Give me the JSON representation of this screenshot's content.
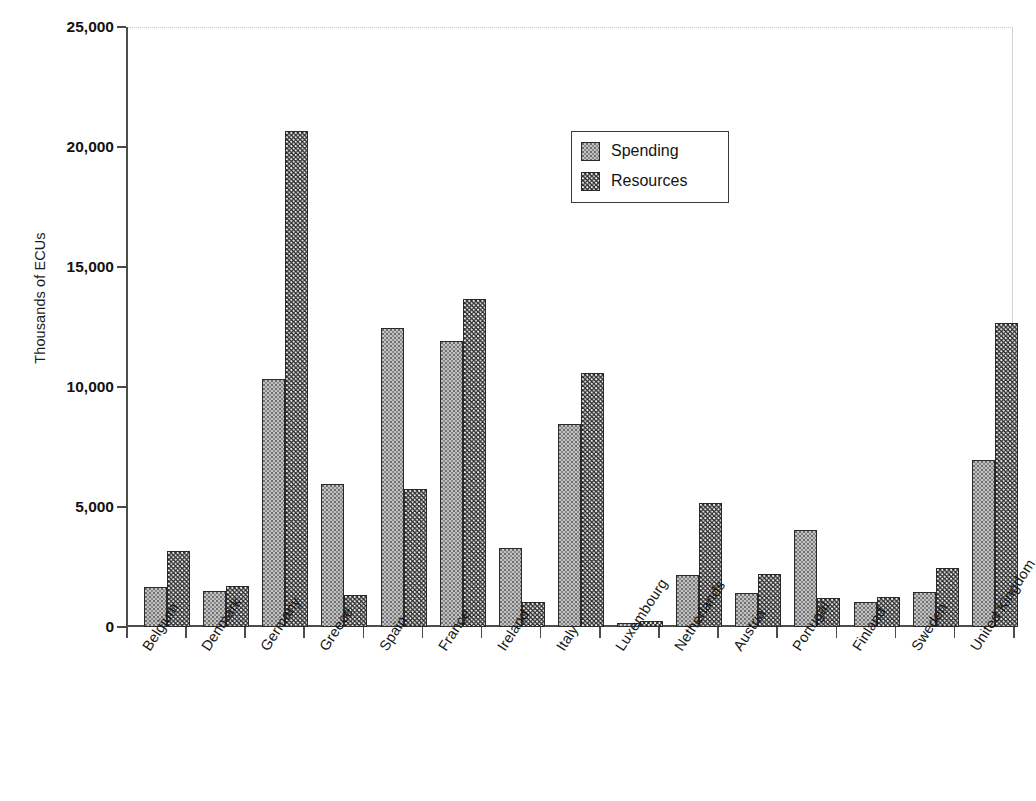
{
  "chart_data": {
    "type": "bar",
    "title": "",
    "xlabel": "",
    "ylabel": "Thousands of ECUs",
    "ylim": [
      0,
      25000
    ],
    "ytick_labels": [
      "0",
      "5,000",
      "10,000",
      "15,000",
      "20,000",
      "25,000"
    ],
    "ytick_values": [
      0,
      5000,
      10000,
      15000,
      20000,
      25000
    ],
    "grid": false,
    "legend_position": "upper-center",
    "categories": [
      "Belgium",
      "Denmark",
      "Germany",
      "Greece",
      "Spain",
      "France",
      "Ireland",
      "Italy",
      "Luxembourg",
      "Netherlands",
      "Austria",
      "Portugal",
      "Finland",
      "Sweden",
      "United Kingdom"
    ],
    "series": [
      {
        "name": "Spending",
        "color": "#c2c2c2",
        "values": [
          1650,
          1500,
          10350,
          5950,
          12450,
          11900,
          3300,
          8450,
          180,
          2150,
          1400,
          4050,
          1050,
          1450,
          6950
        ]
      },
      {
        "name": "Resources",
        "color": "#2e2e2e",
        "values": [
          3150,
          1700,
          20650,
          1350,
          5750,
          13650,
          1050,
          10600,
          250,
          5150,
          2200,
          1200,
          1250,
          2450,
          12650
        ]
      }
    ]
  },
  "legend": {
    "items": [
      {
        "label": "Spending",
        "swatch": "spending"
      },
      {
        "label": "Resources",
        "swatch": "resources"
      }
    ]
  }
}
